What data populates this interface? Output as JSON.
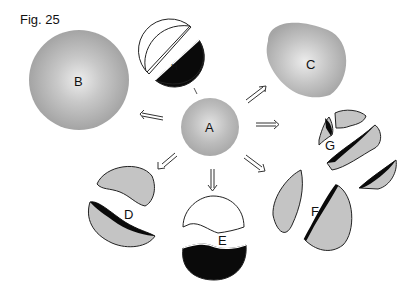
{
  "figure": {
    "title": "Fig. 25",
    "labels": {
      "A": "A",
      "B": "B",
      "C": "C",
      "D": "D",
      "E": "E",
      "F": "F",
      "G": "G",
      "H": "H"
    },
    "colors": {
      "sphere_fill": "#b8b8b8",
      "sphere_highlight": "#e6e6e6",
      "fragment_fill": "#c4c4c4",
      "dark_fill": "#0a0a0a",
      "outline": "#222222"
    }
  }
}
